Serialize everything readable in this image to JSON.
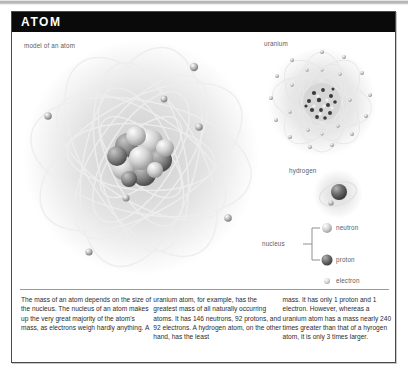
{
  "header": {
    "title": "ATOM"
  },
  "captions": {
    "main": "model of an atom",
    "uranium": "uranium",
    "hydrogen": "hydrogen"
  },
  "legend": {
    "group_label": "nucleus",
    "items": [
      {
        "name": "neutron-swatch",
        "label": "neutron",
        "color": "#c9c9c9"
      },
      {
        "name": "proton-swatch",
        "label": "proton",
        "color": "#6e6e6e"
      },
      {
        "name": "electron-swatch",
        "label": "electron",
        "color": "#d8d8d8"
      }
    ]
  },
  "body": {
    "columns": [
      "The mass of an atom depends on the size of the nucleus. The nucleus of an atom makes up the very great majority of the atom's mass, as electrons weigh hardly anything. A",
      "uranium atom, for example, has the greatest mass of all naturally occurring atoms. It has 146 neutrons, 92 protons, and 92 electrons. A hydrogen atom, on the other hand, has the least",
      "mass. It has only 1 proton and 1 electron. However, whereas a uranium atom has a mass nearly 240 times greater than that of a hyrogen atom, it is only 3 times larger."
    ]
  },
  "diagram": {
    "main_atom": {
      "electrons": [
        {
          "x": 178,
          "y": 33,
          "r": 4.2
        },
        {
          "x": 148,
          "y": 65,
          "r": 3.4
        },
        {
          "x": 183,
          "y": 93,
          "r": 3.8
        },
        {
          "x": 32,
          "y": 82,
          "r": 3.8
        },
        {
          "x": 110,
          "y": 164,
          "r": 3.6
        },
        {
          "x": 212,
          "y": 184,
          "r": 3.8
        },
        {
          "x": 73,
          "y": 218,
          "r": 3.6
        }
      ],
      "nucleus": {
        "cx": 125,
        "cy": 123,
        "r": 28
      }
    },
    "uranium": {
      "electron_count": 22,
      "nucleus_r": 19
    },
    "hydrogen": {
      "electron_count": 1,
      "nucleus_r": 8
    }
  },
  "colors": {
    "title_bar": "#0a0a0a",
    "frame_border": "#4a4a4a",
    "text": "#2c2c2c",
    "caption": "#5d5d5d",
    "orbit": "#e3e3e3"
  }
}
